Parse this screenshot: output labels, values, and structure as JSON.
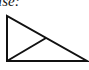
{
  "caption": {
    "text": "ise:"
  },
  "diagram": {
    "stroke_color": "#111111",
    "triangle": {
      "points": [
        [
          7,
          16
        ],
        [
          7,
          61
        ],
        [
          87,
          61
        ]
      ]
    },
    "segment": {
      "from": [
        7,
        61
      ],
      "to": [
        46,
        38
      ]
    }
  }
}
